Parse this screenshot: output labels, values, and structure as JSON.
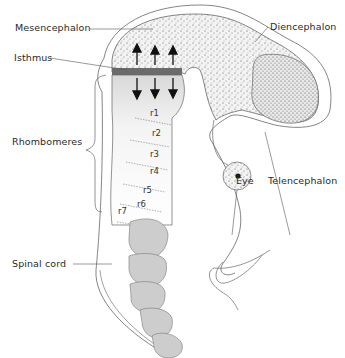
{
  "diagram": {
    "type": "embryonic brain anatomy",
    "labels": {
      "mesencephalon": "Mesencephalon",
      "isthmus": "Isthmus",
      "diencephalon": "Diencephalon",
      "rhombomeres": "Rhombomeres",
      "eye": "Eye",
      "telencephalon": "Telencephalon",
      "spinal_cord": "Spinal cord"
    },
    "rhombomere_labels": [
      "r1",
      "r2",
      "r3",
      "r4",
      "r5",
      "r6",
      "r7"
    ],
    "signaling_arrows": {
      "up_count": 3,
      "down_count": 3
    },
    "colors": {
      "midbrain_forebrain_stipple": "#cfcfcf",
      "hindbrain_fill": "#e6e6e6",
      "spinal_cord_fill": "#cdcdcd",
      "isthmus_band": "#6b6b6b",
      "outline": "#555555"
    }
  }
}
